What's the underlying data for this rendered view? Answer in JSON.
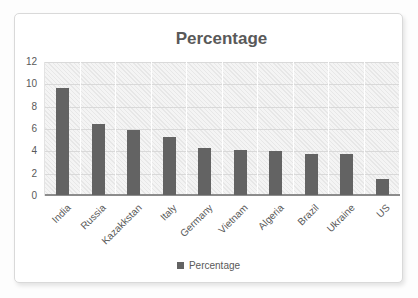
{
  "chart_data": {
    "type": "bar",
    "title": "Percentage",
    "categories": [
      "India",
      "Russia",
      "Kazakkstan",
      "Italy",
      "Germany",
      "Vietnam",
      "Algeria",
      "Brazil",
      "Ukraine",
      "US"
    ],
    "series": [
      {
        "name": "Percentage",
        "values": [
          9.6,
          6.4,
          5.8,
          5.2,
          4.2,
          4.0,
          3.9,
          3.7,
          3.7,
          1.4
        ]
      }
    ],
    "legend_label": "Percentage",
    "legend_position": "bottom",
    "xlabel": "",
    "ylabel": "",
    "ylim": [
      0,
      12
    ],
    "yticks": [
      0,
      2,
      4,
      6,
      8,
      10,
      12
    ],
    "grid": true,
    "plot_fill_pattern": "light-diagonal-hatch",
    "colors": {
      "bar": "#636363",
      "title_text": "#595959",
      "axis_text": "#595959",
      "gridline": "#d9d9d9",
      "vertical_gridline": "#ffffff",
      "axis_line": "#8c8c8c",
      "plot_fill": "#f4f4f4",
      "card_border": "#d9d9d9",
      "card_background": "#ffffff"
    }
  }
}
